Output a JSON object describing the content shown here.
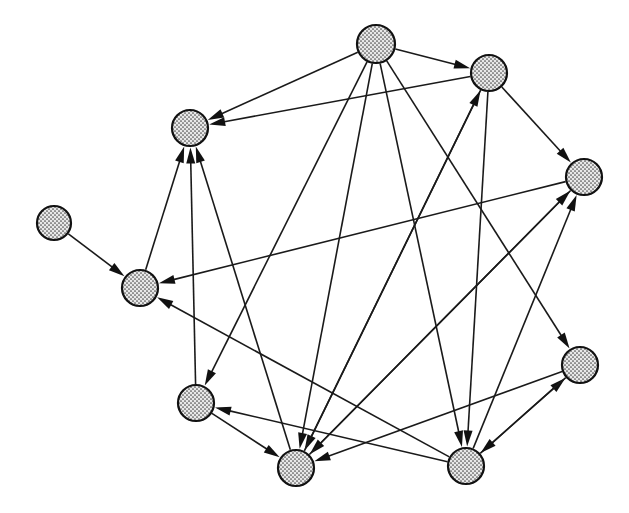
{
  "diagram": {
    "type": "directed-graph",
    "width": 629,
    "height": 513,
    "background_color": "#ffffff",
    "node_style": {
      "fill_pattern": "stipple-dots",
      "fill_color": "#d9d9d9",
      "dot_color": "#555555",
      "stroke_color": "#111111",
      "stroke_width": 2.2,
      "radius": 18
    },
    "edge_style": {
      "stroke_color": "#1a1a1a",
      "stroke_width": 1.6,
      "arrow_fill": "#111111",
      "arrow_length": 16,
      "arrow_width": 9
    },
    "nodes": [
      {
        "id": "n0",
        "label": "isolated-left",
        "x": 54,
        "y": 223,
        "r": 17
      },
      {
        "id": "n1",
        "label": "upper-left",
        "x": 190,
        "y": 128,
        "r": 18
      },
      {
        "id": "n2",
        "label": "top",
        "x": 376,
        "y": 44,
        "r": 19
      },
      {
        "id": "n3",
        "label": "upper-right",
        "x": 489,
        "y": 73,
        "r": 18
      },
      {
        "id": "n4",
        "label": "right",
        "x": 584,
        "y": 177,
        "r": 18
      },
      {
        "id": "n5",
        "label": "left-middle",
        "x": 140,
        "y": 288,
        "r": 18
      },
      {
        "id": "n6",
        "label": "bottom-left",
        "x": 196,
        "y": 403,
        "r": 18
      },
      {
        "id": "n7",
        "label": "bottom-center",
        "x": 296,
        "y": 468,
        "r": 18
      },
      {
        "id": "n8",
        "label": "bottom-right-center",
        "x": 466,
        "y": 466,
        "r": 18
      },
      {
        "id": "n9",
        "label": "lower-right",
        "x": 580,
        "y": 365,
        "r": 18
      }
    ],
    "edges": [
      {
        "from": "n0",
        "to": "n5"
      },
      {
        "from": "n2",
        "to": "n1"
      },
      {
        "from": "n2",
        "to": "n3"
      },
      {
        "from": "n2",
        "to": "n7"
      },
      {
        "from": "n2",
        "to": "n8"
      },
      {
        "from": "n2",
        "to": "n9"
      },
      {
        "from": "n2",
        "to": "n6"
      },
      {
        "from": "n3",
        "to": "n1"
      },
      {
        "from": "n3",
        "to": "n4"
      },
      {
        "from": "n3",
        "to": "n7"
      },
      {
        "from": "n3",
        "to": "n8"
      },
      {
        "from": "n4",
        "to": "n5"
      },
      {
        "from": "n4",
        "to": "n7"
      },
      {
        "from": "n5",
        "to": "n1"
      },
      {
        "from": "n6",
        "to": "n1"
      },
      {
        "from": "n6",
        "to": "n7"
      },
      {
        "from": "n7",
        "to": "n1"
      },
      {
        "from": "n7",
        "to": "n4"
      },
      {
        "from": "n7",
        "to": "n3"
      },
      {
        "from": "n8",
        "to": "n4"
      },
      {
        "from": "n8",
        "to": "n5"
      },
      {
        "from": "n8",
        "to": "n6"
      },
      {
        "from": "n8",
        "to": "n9"
      },
      {
        "from": "n9",
        "to": "n7"
      },
      {
        "from": "n9",
        "to": "n8"
      }
    ],
    "node_count": 10,
    "edge_count": 25
  }
}
